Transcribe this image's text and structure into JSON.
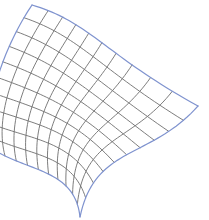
{
  "figure": {
    "width": 209,
    "height": 220,
    "background": "#ffffff"
  },
  "mesh": {
    "u_divisions": 10,
    "v_divisions": 10,
    "grid_color": "#6e6e6e",
    "grid_width": 0.9,
    "edge_color": "#7f93cf",
    "edge_width": 1.2,
    "corners": {
      "top_left": [
        32,
        5
      ],
      "right": [
        198,
        106
      ],
      "bottom": [
        80,
        217
      ],
      "left": [
        -6,
        150
      ]
    },
    "edges": {
      "top": [
        [
          32,
          5
        ],
        [
          90,
          22
        ],
        [
          105,
          55
        ],
        [
          198,
          106
        ]
      ],
      "right": [
        [
          198,
          106
        ],
        [
          150,
          160
        ],
        [
          95,
          145
        ],
        [
          80,
          217
        ]
      ],
      "left": [
        [
          32,
          5
        ],
        [
          5,
          45
        ],
        [
          -20,
          110
        ],
        [
          -6,
          150
        ]
      ],
      "bottom": [
        [
          -6,
          150
        ],
        [
          30,
          172
        ],
        [
          75,
          170
        ],
        [
          80,
          217
        ]
      ]
    }
  }
}
